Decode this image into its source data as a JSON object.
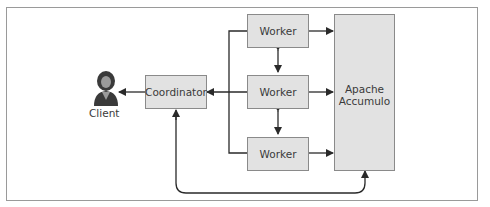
{
  "diagram": {
    "nodes": {
      "client": {
        "label": "Client",
        "icon": "person-icon"
      },
      "coordinator": {
        "label": "Coordinator"
      },
      "worker1": {
        "label": "Worker"
      },
      "worker2": {
        "label": "Worker"
      },
      "worker3": {
        "label": "Worker"
      },
      "accumulo": {
        "label": "Apache\nAccumulo"
      }
    },
    "edges": [
      {
        "from": "coordinator",
        "to": "client"
      },
      {
        "from": "worker1",
        "to": "coordinator"
      },
      {
        "from": "worker2",
        "to": "coordinator"
      },
      {
        "from": "worker3",
        "to": "coordinator"
      },
      {
        "from": "worker1",
        "to": "worker2",
        "bidirectional": true
      },
      {
        "from": "worker2",
        "to": "worker3",
        "bidirectional": true
      },
      {
        "from": "worker1",
        "to": "accumulo"
      },
      {
        "from": "worker2",
        "to": "accumulo"
      },
      {
        "from": "worker3",
        "to": "accumulo"
      },
      {
        "from": "accumulo",
        "to": "coordinator",
        "bidirectional": true
      }
    ],
    "colors": {
      "box_fill": "#e2e2e2",
      "box_border": "#8a8a8a",
      "line": "#2a2a2a",
      "text": "#3a3a3a"
    }
  }
}
